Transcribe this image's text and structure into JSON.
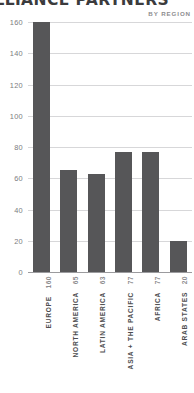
{
  "chart_data": {
    "type": "bar",
    "title": "ALLIANCE PARTNERS",
    "subtitle": "BY REGION",
    "xlabel": "",
    "ylabel": "",
    "ylim": [
      0,
      160
    ],
    "yticks": [
      160,
      140,
      120,
      100,
      80,
      60,
      40,
      20,
      0
    ],
    "grid": true,
    "legend": false,
    "categories": [
      "EUROPE",
      "NORTH AMERICA",
      "LATIN AMERICA",
      "ASIA + THE PACIFIC",
      "AFRICA",
      "ARAB STATES"
    ],
    "values": [
      160,
      65,
      63,
      77,
      77,
      20
    ],
    "bar_color": "#565658",
    "grid_color": "#d7d7d9",
    "axis_color": "#9b9b9e",
    "text_color": "#58585a"
  }
}
